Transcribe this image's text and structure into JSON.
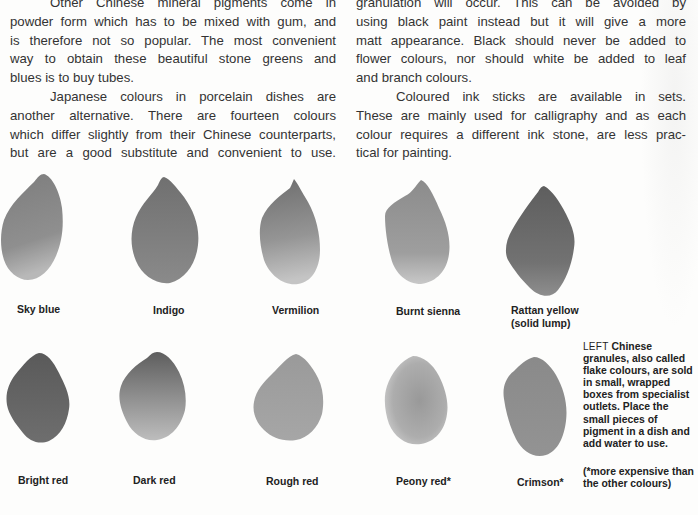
{
  "body_text": {
    "left_column": [
      {
        "text": "Other Chinese mineral pigments come in",
        "indent": true,
        "last": false
      },
      {
        "text": "powder form which has to be mixed with gum, and",
        "indent": false,
        "last": false
      },
      {
        "text": "is therefore not so popular. The most convenient",
        "indent": false,
        "last": false
      },
      {
        "text": "way to obtain these beautiful stone greens and",
        "indent": false,
        "last": false
      },
      {
        "text": "blues is to buy tubes.",
        "indent": false,
        "last": true
      },
      {
        "text": "Japanese colours in porcelain dishes are",
        "indent": true,
        "last": false
      },
      {
        "text": "another alternative. There are fourteen colours",
        "indent": false,
        "last": false
      },
      {
        "text": "which differ slightly from their Chinese counterparts,",
        "indent": false,
        "last": false
      },
      {
        "text": "but are a good substitute and convenient to use.",
        "indent": false,
        "last": false
      }
    ],
    "right_column": [
      {
        "text": "granulation will occur. This can be avoided by",
        "indent": false,
        "last": false
      },
      {
        "text": "using black paint instead but it will give a more",
        "indent": false,
        "last": false
      },
      {
        "text": "matt appearance. Black should never be added to",
        "indent": false,
        "last": false
      },
      {
        "text": "flower colours, nor should white be added to leaf",
        "indent": false,
        "last": false
      },
      {
        "text": "and branch colours.",
        "indent": false,
        "last": true
      },
      {
        "text": "Coloured ink sticks are available in sets.",
        "indent": true,
        "last": false
      },
      {
        "text": "These are mainly used for calligraphy and as each",
        "indent": false,
        "last": false
      },
      {
        "text": "colour requires a different ink stone, are less prac-",
        "indent": false,
        "last": false
      },
      {
        "text": "tical for painting.",
        "indent": false,
        "last": true
      }
    ]
  },
  "pigments": [
    {
      "name": "Sky blue",
      "label_lines": [
        "Sky blue"
      ],
      "tone": "#8f8f8f"
    },
    {
      "name": "Indigo",
      "label_lines": [
        "Indigo"
      ],
      "tone": "#7f7f7f"
    },
    {
      "name": "Vermilion",
      "label_lines": [
        "Vermilion"
      ],
      "tone": "#8a8a8a"
    },
    {
      "name": "Burnt sienna",
      "label_lines": [
        "Burnt sienna"
      ],
      "tone": "#979797"
    },
    {
      "name": "Rattan yellow",
      "label_lines": [
        "Rattan yellow",
        "(solid lump)"
      ],
      "tone": "#6f6f6f"
    },
    {
      "name": "Bright red",
      "label_lines": [
        "Bright red"
      ],
      "tone": "#6a6a6a"
    },
    {
      "name": "Dark red",
      "label_lines": [
        "Dark red"
      ],
      "tone": "#8a8a8a"
    },
    {
      "name": "Rough red",
      "label_lines": [
        "Rough red"
      ],
      "tone": "#a0a0a0"
    },
    {
      "name": "Peony red",
      "label_lines": [
        "Peony red*"
      ],
      "tone": "#a3a3a3"
    },
    {
      "name": "Crimson",
      "label_lines": [
        "Crimson*"
      ],
      "tone": "#8e8e8e"
    }
  ],
  "caption": {
    "lead": "LEFT",
    "text": "Chinese granules, also called flake colours, are sold in small, wrapped boxes from specialist outlets. Place the small pieces of pigment in a dish and add water to use.",
    "footnote": "(*more expensive than the other colours)"
  }
}
